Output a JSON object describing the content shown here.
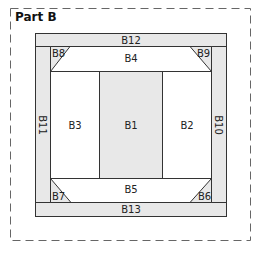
{
  "title": "Part B",
  "colors": {
    "shaded": "#e8e8e8",
    "stroke": "#333333",
    "dash": "#666666",
    "white": "#ffffff"
  },
  "pieces": {
    "B1": "B1",
    "B2": "B2",
    "B3": "B3",
    "B4": "B4",
    "B5": "B5",
    "B6": "B6",
    "B7": "B7",
    "B8": "B8",
    "B9": "B9",
    "B10": "B10",
    "B11": "B11",
    "B12": "B12",
    "B13": "B13"
  }
}
